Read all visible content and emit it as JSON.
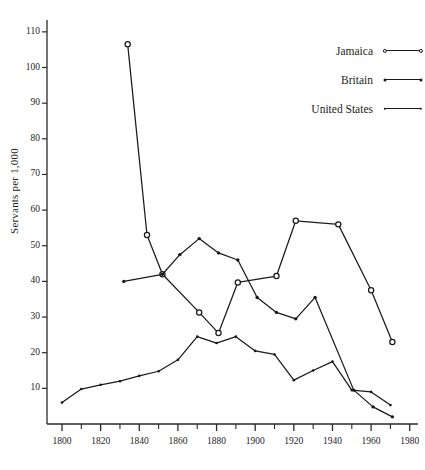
{
  "chart_data": {
    "type": "line",
    "title": "",
    "xlabel": "",
    "ylabel": "Servants per 1,000",
    "xlim": [
      1795,
      1990
    ],
    "ylim": [
      0,
      110
    ],
    "grid": false,
    "legend_position": "top-right",
    "x_ticks_major": [
      1800,
      1820,
      1840,
      1860,
      1880,
      1900,
      1920,
      1940,
      1960,
      1980
    ],
    "x_tick_labels": [
      "1800",
      "1820",
      "1840",
      "1860",
      "1880",
      "1900",
      "1920",
      "1940",
      "1960",
      "1980"
    ],
    "x_ticks_minor": [
      1810,
      1830,
      1850,
      1870,
      1890,
      1910,
      1930,
      1950,
      1970
    ],
    "y_ticks": [
      10,
      20,
      30,
      40,
      50,
      60,
      70,
      80,
      90,
      100,
      110
    ],
    "y_tick_labels": [
      "10",
      "20",
      "30",
      "40",
      "50",
      "60",
      "70",
      "80",
      "90",
      "100",
      "110"
    ],
    "series": [
      {
        "name": "Jamaica",
        "marker": "open-circle",
        "color": "#1a1a1a",
        "x": [
          1834,
          1844,
          1852,
          1871,
          1881,
          1891,
          1911,
          1921,
          1943,
          1960,
          1971
        ],
        "values": [
          106.5,
          53.0,
          42.0,
          31.3,
          25.5,
          39.7,
          41.5,
          57.0,
          56.0,
          37.5,
          23.0
        ]
      },
      {
        "name": "Britain",
        "marker": "dot",
        "color": "#1a1a1a",
        "x": [
          1832,
          1852,
          1861,
          1871,
          1881,
          1891,
          1901,
          1911,
          1921,
          1931,
          1951,
          1961,
          1971
        ],
        "values": [
          40.0,
          42.0,
          47.5,
          52.0,
          48.0,
          46.0,
          35.5,
          31.3,
          29.5,
          35.5,
          9.5,
          4.8,
          2.0
        ]
      },
      {
        "name": "United States",
        "marker": "small-dot",
        "color": "#1a1a1a",
        "x": [
          1800,
          1810,
          1820,
          1830,
          1840,
          1850,
          1860,
          1870,
          1880,
          1890,
          1900,
          1910,
          1920,
          1930,
          1940,
          1950,
          1960,
          1970
        ],
        "values": [
          6.0,
          9.8,
          11.0,
          12.0,
          13.5,
          14.8,
          18.0,
          24.5,
          22.7,
          24.5,
          20.5,
          19.5,
          12.3,
          15.0,
          17.5,
          9.5,
          9.0,
          5.3
        ]
      }
    ]
  },
  "legend": {
    "entries": [
      {
        "label": "Jamaica",
        "marker": "open-circle"
      },
      {
        "label": "Britain",
        "marker": "dot"
      },
      {
        "label": "United States",
        "marker": "small-dot"
      }
    ]
  },
  "axis": {
    "y_title": "Servants per 1,000"
  }
}
